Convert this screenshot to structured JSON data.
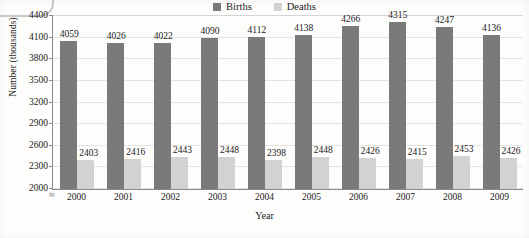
{
  "chart_data": {
    "type": "bar",
    "title": "",
    "xlabel": "Year",
    "ylabel": "Number (thousands)",
    "categories": [
      "2000",
      "2001",
      "2002",
      "2003",
      "2004",
      "2005",
      "2006",
      "2007",
      "2008",
      "2009"
    ],
    "series": [
      {
        "name": "Births",
        "color": "#7a7a7a",
        "values": [
          4059,
          4026,
          4022,
          4090,
          4112,
          4138,
          4266,
          4315,
          4247,
          4136
        ]
      },
      {
        "name": "Deaths",
        "color": "#d2d2d2",
        "values": [
          2403,
          2416,
          2443,
          2448,
          2398,
          2448,
          2426,
          2415,
          2453,
          2426
        ]
      }
    ],
    "ylim": [
      2000,
      4400
    ],
    "ytick_values": [
      2000,
      2300,
      2600,
      2900,
      3200,
      3500,
      3800,
      4100,
      4400
    ],
    "ytick_labels": [
      "2000",
      "2300",
      "2600",
      "2900",
      "3200",
      "3500",
      "3800",
      "4100",
      "4400"
    ],
    "grid": true,
    "legend_position": "top-center",
    "axis_break_symbol": "≈"
  },
  "legend": {
    "entries": [
      {
        "label": "Births",
        "color": "#7a7a7a"
      },
      {
        "label": "Deaths",
        "color": "#d2d2d2"
      }
    ]
  }
}
